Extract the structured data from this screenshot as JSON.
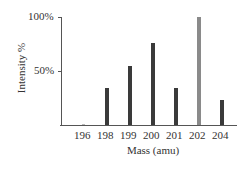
{
  "chart_data": {
    "type": "bar",
    "title": "",
    "xlabel": "Mass (amu)",
    "ylabel": "Intensity %",
    "categories": [
      "196",
      "198",
      "199",
      "200",
      "201",
      "202",
      "204"
    ],
    "values": [
      0.5,
      34,
      55,
      76,
      34,
      100,
      23
    ],
    "bar_colors": [
      "#3a3a3a",
      "#3a3a3a",
      "#3a3a3a",
      "#3a3a3a",
      "#3a3a3a",
      "#8a8a8a",
      "#3a3a3a"
    ],
    "yticks": [
      "50%",
      "100%"
    ],
    "ytick_values": [
      50,
      100
    ],
    "ylim": [
      0,
      100
    ],
    "grid": false,
    "legend": null
  }
}
